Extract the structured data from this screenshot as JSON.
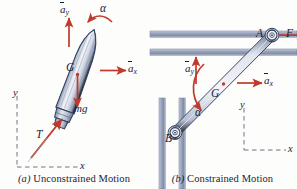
{
  "figure": {
    "type": "engineering-mechanics-diagram",
    "panels": [
      {
        "id": "a",
        "tag": "(a)",
        "caption": "Unconstrained Motion",
        "subject": "rocket",
        "labels": {
          "a_y": "a",
          "a_y_sub": "y",
          "a_x": "a",
          "a_x_sub": "x",
          "alpha": "α",
          "G": "G",
          "mg": "mg",
          "T": "T",
          "axis_y": "y",
          "axis_x": "x"
        },
        "vectors": [
          {
            "name": "a-y-acceleration",
            "label": "āy",
            "direction": "up"
          },
          {
            "name": "a-x-acceleration",
            "label": "āx",
            "direction": "right"
          },
          {
            "name": "weight",
            "label": "mg",
            "direction": "down"
          },
          {
            "name": "thrust",
            "label": "T",
            "direction": "up-along-axis"
          },
          {
            "name": "angular-acceleration",
            "label": "α",
            "direction": "curved-ccw"
          }
        ]
      },
      {
        "id": "b",
        "tag": "(b)",
        "caption": "Constrained Motion",
        "subject": "slider-crank-bar",
        "labels": {
          "a_y": "a",
          "a_y_sub": "y",
          "a_x": "a",
          "a_x_sub": "x",
          "alpha": "α",
          "G": "G",
          "A": "A",
          "B": "B",
          "F": "F",
          "axis_y": "y",
          "axis_x": "x"
        },
        "vectors": [
          {
            "name": "a-y-acceleration",
            "label": "āy",
            "direction": "up"
          },
          {
            "name": "a-x-acceleration",
            "label": "āx",
            "direction": "right"
          },
          {
            "name": "applied-force",
            "label": "F",
            "direction": "right"
          },
          {
            "name": "angular-acceleration",
            "label": "α",
            "direction": "curved-ccw"
          }
        ]
      }
    ],
    "colors": {
      "arrow_red": "#c0392b",
      "body_blue": "#aab4cc",
      "body_blue_dark": "#6f7d99",
      "rail_gray": "#9aa4bb",
      "label_ink": "#16213c",
      "dash_gray": "#8a8f9e",
      "background": "#fdfdfc"
    }
  }
}
